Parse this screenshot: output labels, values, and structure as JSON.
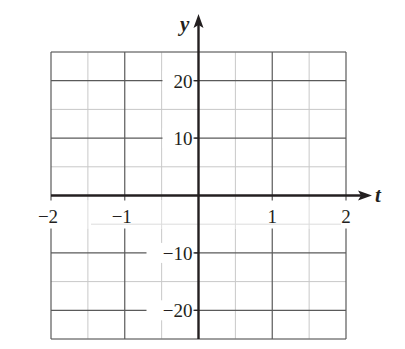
{
  "chart_data": {
    "type": "line",
    "title": "",
    "xlabel": "t",
    "ylabel": "y",
    "xlim": [
      -2,
      2
    ],
    "ylim": [
      -25,
      25
    ],
    "x_ticks": [
      -2,
      -1,
      1,
      2
    ],
    "x_tick_labels": [
      "−2",
      "−1",
      "1",
      "2"
    ],
    "y_ticks": [
      20,
      10,
      -10,
      -20
    ],
    "y_tick_labels": [
      "20",
      "10",
      "−10",
      "−20"
    ],
    "x_minor_step": 0.5,
    "y_minor_step": 5,
    "grid": true,
    "series": []
  },
  "colors": {
    "axis": "#231f20",
    "major_grid": "#5a5a5a",
    "minor_grid": "#c8c8c8",
    "background": "#ffffff"
  }
}
